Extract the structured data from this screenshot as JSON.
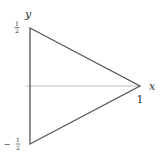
{
  "diagram": {
    "axes": {
      "x_label": "x",
      "y_label": "y"
    },
    "ticks": {
      "y_top_num": "1",
      "y_top_den": "2",
      "y_bottom_sign": "−",
      "y_bottom_num": "1",
      "y_bottom_den": "2",
      "x_one": "1"
    },
    "vertices": [
      {
        "x": 0,
        "y": 0.5
      },
      {
        "x": 0,
        "y": -0.5
      },
      {
        "x": 1,
        "y": 0
      }
    ],
    "colors": {
      "triangle_stroke": "#555555",
      "axis_stroke": "#bbbbbb",
      "text": "#333333"
    }
  }
}
